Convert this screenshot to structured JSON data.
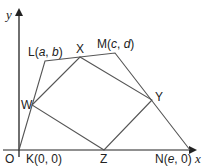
{
  "colors": {
    "stroke": "#555555",
    "axis": "#222222",
    "text": "#222222",
    "background": "#ffffff"
  },
  "axes": {
    "x_label": "x",
    "y_label": "y",
    "origin_label": "O"
  },
  "outer_quadrilateral": {
    "name": "KLMN",
    "vertices": [
      {
        "id": "K",
        "label": "K(0, 0)",
        "name": "K",
        "coords": "0, 0",
        "px": [
          19,
          150
        ]
      },
      {
        "id": "L",
        "label": "L(a, b)",
        "name": "L",
        "a": "a",
        "b": "b",
        "px": [
          45,
          61
        ]
      },
      {
        "id": "M",
        "label": "M(c, d)",
        "name": "M",
        "a": "c",
        "b": "d",
        "px": [
          115,
          53
        ]
      },
      {
        "id": "N",
        "label": "N(e, 0)",
        "name": "N",
        "a": "e",
        "b": "0",
        "px": [
          190,
          150
        ]
      }
    ]
  },
  "inner_quadrilateral": {
    "name": "WXYZ",
    "description": "Midpoints of the sides of KLMN",
    "vertices": [
      {
        "id": "W",
        "label": "W",
        "px": [
          32,
          105
        ]
      },
      {
        "id": "X",
        "label": "X",
        "px": [
          80,
          57
        ]
      },
      {
        "id": "Y",
        "label": "Y",
        "px": [
          152,
          100
        ]
      },
      {
        "id": "Z",
        "label": "Z",
        "px": [
          104,
          150
        ]
      }
    ]
  },
  "labels": {
    "K": {
      "prefix": "K(",
      "a": "0",
      "sep": ", ",
      "b": "0",
      "suffix": ")"
    },
    "L": {
      "prefix": "L(",
      "a": "a",
      "sep": ", ",
      "b": "b",
      "suffix": ")"
    },
    "M": {
      "prefix": "M(",
      "a": "c",
      "sep": ", ",
      "b": "d",
      "suffix": ")"
    },
    "N": {
      "prefix": "N(",
      "a": "e",
      "sep": ", ",
      "b": "0",
      "suffix": ")"
    },
    "W": "W",
    "X": "X",
    "Y": "Y",
    "Z": "Z"
  }
}
